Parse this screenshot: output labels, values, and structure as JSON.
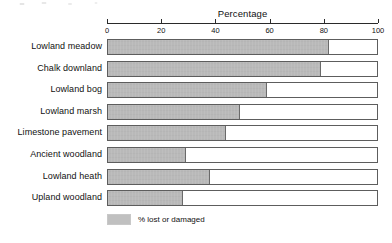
{
  "chart_data": {
    "type": "bar",
    "orientation": "horizontal",
    "title": "Percentage",
    "xlabel": "Percentage",
    "ylabel": "",
    "xlim": [
      0,
      100
    ],
    "xticks": [
      0,
      20,
      40,
      60,
      80,
      100
    ],
    "grid": false,
    "legend_position": "bottom-left",
    "categories": [
      "Lowland meadow",
      "Chalk downland",
      "Lowland bog",
      "Lowland marsh",
      "Limestone pavement",
      "Ancient woodland",
      "Lowland heath",
      "Upland woodland"
    ],
    "series": [
      {
        "name": "% lost or damaged",
        "color": "#b9b9b9",
        "values": [
          82,
          79,
          59,
          49,
          44,
          29,
          38,
          28
        ]
      }
    ]
  },
  "legend": {
    "label": "% lost or damaged"
  }
}
